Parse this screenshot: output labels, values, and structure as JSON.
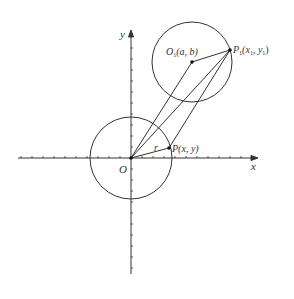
{
  "diagram": {
    "labels": {
      "x_axis": "x",
      "y_axis": "y",
      "origin": "O",
      "radius": "r",
      "point_p": "P(x,  y)",
      "point_p_name": "P",
      "point_p_coords": "(x,  y)",
      "center_o1_name": "O",
      "center_o1_sub": "1",
      "center_o1_coords": "(a,  b)",
      "point_p1_name": "P",
      "point_p1_sub": "1",
      "point_p1_coords": "(x",
      "point_p1_coords_mid": ",  y",
      "point_p1_coords_end": ")",
      "sub1": "1"
    },
    "colors": {
      "stroke": "#333333",
      "background": "#ffffff"
    }
  }
}
